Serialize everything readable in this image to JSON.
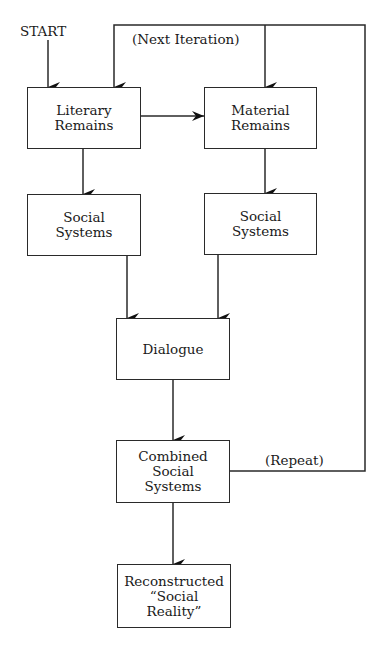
{
  "diagram": {
    "start_label": "START",
    "next_iteration_label": "(Next Iteration)",
    "repeat_label": "(Repeat)",
    "nodes": {
      "literary": "Literary\nRemains",
      "material": "Material\nRemains",
      "social_left": "Social\nSystems",
      "social_right": "Social\nSystems",
      "dialogue": "Dialogue",
      "combined": "Combined\nSocial\nSystems",
      "reconstructed": "Reconstructed\n“Social\nReality”"
    },
    "edges": [
      {
        "from": "START",
        "to": "literary"
      },
      {
        "from": "literary",
        "to": "material"
      },
      {
        "from": "literary",
        "to": "social_left"
      },
      {
        "from": "material",
        "to": "social_right"
      },
      {
        "from": "social_left",
        "to": "dialogue"
      },
      {
        "from": "social_right",
        "to": "dialogue"
      },
      {
        "from": "dialogue",
        "to": "combined"
      },
      {
        "from": "combined",
        "to": "reconstructed"
      },
      {
        "from": "combined",
        "to": "literary",
        "label": "(Repeat) / (Next Iteration)"
      },
      {
        "from": "combined",
        "to": "material",
        "label": "(Repeat) / (Next Iteration)"
      }
    ]
  }
}
